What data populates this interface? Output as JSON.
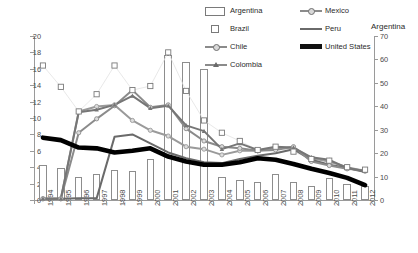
{
  "legend": {
    "items": [
      {
        "label": "Argentina",
        "marker": "open-bar",
        "col": 0,
        "row": 0
      },
      {
        "label": "Mexico",
        "marker": "line-circle",
        "col": 1,
        "row": 0
      },
      {
        "label": "Brazil",
        "marker": "open-square",
        "col": 0,
        "row": 1
      },
      {
        "label": "Peru",
        "marker": "line-plain",
        "col": 1,
        "row": 1
      },
      {
        "label": "Chile",
        "marker": "line-circle-small",
        "col": 0,
        "row": 2
      },
      {
        "label": "United States",
        "marker": "line-thick-black",
        "col": 1,
        "row": 2
      },
      {
        "label": "Colombia",
        "marker": "line-triangle",
        "col": 0,
        "row": 3
      }
    ]
  },
  "chart_data": {
    "type": "line",
    "title": "",
    "xlabel": "",
    "ylabel": "",
    "y2label": "Argentina",
    "ylim": [
      0,
      20
    ],
    "y2lim": [
      0,
      70
    ],
    "yticks": [
      0,
      2,
      4,
      6,
      8,
      10,
      12,
      14,
      16,
      18,
      20
    ],
    "y2ticks": [
      0,
      10,
      20,
      30,
      40,
      50,
      60,
      70
    ],
    "grid": false,
    "legend_position": "top-right",
    "categories": [
      "1994",
      "1995",
      "1996",
      "1997",
      "1998",
      "1999",
      "2000",
      "2001",
      "2002",
      "2003",
      "2004",
      "2005",
      "2006",
      "2007",
      "2008",
      "2009",
      "2010",
      "2011",
      "2012"
    ],
    "bar_series": [
      {
        "name": "Argentina",
        "axis": "right",
        "type": "bar",
        "color": "#ffffff",
        "edge": "#8d8d8d",
        "values": [
          15.0,
          13.5,
          10.0,
          11.0,
          12.8,
          12.5,
          17.5,
          62.0,
          59.0,
          56.0,
          9.8,
          8.5,
          7.8,
          11.2,
          7.8,
          6.0,
          9.2,
          7.0,
          6.0
        ]
      }
    ],
    "marker_series": [
      {
        "name": "Brazil",
        "axis": "left",
        "type": "scatter",
        "color": "#7a7a7a",
        "values": [
          16.4,
          13.8,
          10.8,
          12.9,
          16.4,
          13.4,
          13.9,
          18.0,
          13.3,
          9.7,
          8.2,
          7.2,
          6.1,
          6.5,
          5.9,
          5.0,
          4.8,
          4.0,
          3.7
        ]
      }
    ],
    "series": [
      {
        "name": "Mexico",
        "axis": "left",
        "color": "#9a9a9a",
        "marker": "circle",
        "values": [
          0.15,
          0.15,
          10.8,
          11.4,
          11.6,
          9.7,
          8.5,
          7.8,
          6.5,
          6.2,
          5.5,
          6.0,
          6.0,
          6.3,
          6.4,
          5.1,
          4.7,
          4.0,
          3.5
        ]
      },
      {
        "name": "Peru",
        "axis": "left",
        "color": "#6a6a6a",
        "marker": "none",
        "values": [
          0.15,
          0.15,
          0.2,
          0.2,
          7.7,
          8.0,
          6.9,
          5.8,
          5.1,
          4.6,
          4.5,
          5.0,
          5.4,
          5.7,
          6.2,
          4.9,
          4.3,
          3.9,
          3.4
        ]
      },
      {
        "name": "Chile",
        "axis": "left",
        "color": "#8b8b8b",
        "marker": "circle",
        "values": [
          0.15,
          0.15,
          8.2,
          9.9,
          11.5,
          13.4,
          11.3,
          11.6,
          8.7,
          7.2,
          6.5,
          6.3,
          6.0,
          6.1,
          6.5,
          4.7,
          4.2,
          3.8,
          3.6
        ]
      },
      {
        "name": "Colombia",
        "axis": "left",
        "color": "#767676",
        "marker": "triangle",
        "values": [
          0.15,
          0.15,
          10.7,
          11.0,
          11.6,
          12.7,
          11.2,
          11.5,
          9.1,
          8.4,
          6.2,
          6.9,
          6.1,
          6.5,
          6.4,
          5.2,
          4.9,
          3.9,
          3.5
        ]
      },
      {
        "name": "United States",
        "axis": "left",
        "color": "#000000",
        "marker": "none",
        "thick": true,
        "values": [
          7.6,
          7.3,
          6.4,
          6.3,
          5.8,
          6.0,
          6.3,
          5.3,
          4.7,
          4.3,
          4.3,
          4.6,
          5.1,
          4.9,
          4.4,
          3.8,
          3.3,
          2.7,
          1.8
        ]
      }
    ]
  }
}
